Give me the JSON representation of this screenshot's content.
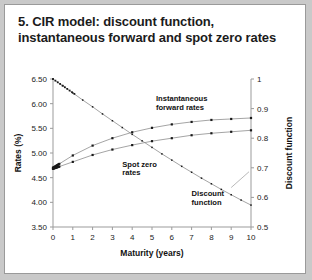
{
  "title": "5. CIR model: discount function, instantaneous forward and spot zero rates",
  "chart_data": {
    "type": "line",
    "title": "5. CIR model: discount function, instantaneous forward and spot zero rates",
    "xlabel": "Maturity (years)",
    "ylabel": "Rates (%)",
    "y2label": "Discount function",
    "xlim": [
      0,
      10
    ],
    "ylim": [
      3.5,
      6.5
    ],
    "y2lim": [
      0.5,
      1.0
    ],
    "xticks": [
      0,
      1,
      2,
      3,
      4,
      5,
      6,
      7,
      8,
      9,
      10
    ],
    "xticklabels": [
      "0",
      "1",
      "2",
      "3",
      "4",
      "5",
      "6",
      "7",
      "8",
      "9",
      "10"
    ],
    "yticks": [
      3.5,
      4.0,
      4.5,
      5.0,
      5.5,
      6.0,
      6.5
    ],
    "yticklabels": [
      "3.50",
      "4.00",
      "4.50",
      "5.00",
      "5.50",
      "6.00",
      "6.50"
    ],
    "y2ticks": [
      0.5,
      0.6,
      0.7,
      0.8,
      0.9,
      1.0
    ],
    "y2ticklabels": [
      "0.5",
      "0.6",
      "0.7",
      "0.8",
      "0.9",
      "1"
    ],
    "grid": false,
    "legend": "annotations",
    "annotations": [
      {
        "text": "Instantaneous forward rates",
        "x": 5.2,
        "y": 6.05,
        "series": "instantaneous_forward_rates"
      },
      {
        "text": "Spot zero rates",
        "x": 3.5,
        "y": 4.72,
        "series": "spot_zero_rates"
      },
      {
        "text": "Discount function",
        "x": 7.0,
        "y": 4.12,
        "series": "discount_function"
      }
    ],
    "series": [
      {
        "name": "Instantaneous forward rates",
        "axis": "left",
        "x": [
          0,
          1,
          2,
          3,
          4,
          5,
          6,
          7,
          8,
          9,
          10
        ],
        "values": [
          4.7,
          4.95,
          5.15,
          5.3,
          5.42,
          5.51,
          5.58,
          5.63,
          5.67,
          5.69,
          5.71
        ]
      },
      {
        "name": "Spot zero rates",
        "axis": "left",
        "x": [
          0,
          1,
          2,
          3,
          4,
          5,
          6,
          7,
          8,
          9,
          10
        ],
        "values": [
          4.68,
          4.82,
          4.96,
          5.07,
          5.16,
          5.24,
          5.3,
          5.36,
          5.4,
          5.43,
          5.46
        ]
      },
      {
        "name": "Discount function",
        "axis": "right",
        "x": [
          0,
          0.5,
          1,
          1.5,
          2,
          2.5,
          3,
          3.5,
          4,
          4.5,
          5,
          5.5,
          6,
          6.5,
          7,
          7.5,
          8,
          8.5,
          9,
          9.5,
          10
        ],
        "values": [
          1.0,
          0.977,
          0.953,
          0.929,
          0.906,
          0.882,
          0.859,
          0.836,
          0.813,
          0.791,
          0.769,
          0.747,
          0.726,
          0.705,
          0.685,
          0.665,
          0.646,
          0.627,
          0.609,
          0.591,
          0.574
        ]
      }
    ]
  }
}
